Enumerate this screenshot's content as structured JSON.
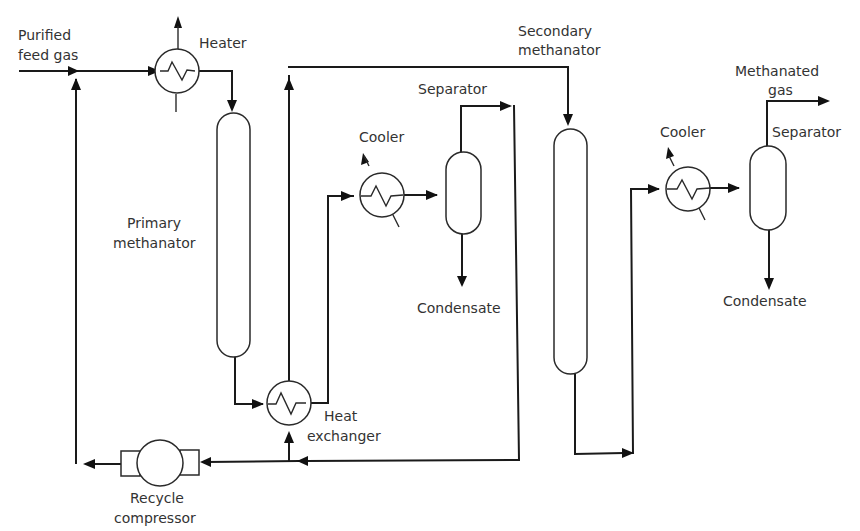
{
  "diagram": {
    "type": "process flow diagram",
    "labels": {
      "feed_line1": "Purified",
      "feed_line2": "feed gas",
      "heater": "Heater",
      "primary_line1": "Primary",
      "primary_line2": "methanator",
      "heat_exchanger_line1": "Heat",
      "heat_exchanger_line2": "exchanger",
      "cooler1": "Cooler",
      "separator1": "Separator",
      "condensate1": "Condensate",
      "secondary_line1": "Secondary",
      "secondary_line2": "methanator",
      "cooler2": "Cooler",
      "separator2": "Separator",
      "product_line1": "Methanated",
      "product_line2": "gas",
      "condensate2": "Condensate",
      "compressor_line1": "Recycle",
      "compressor_line2": "compressor"
    },
    "nodes": [
      {
        "id": "feed",
        "label": "Purified feed gas",
        "kind": "inlet"
      },
      {
        "id": "heater",
        "label": "Heater",
        "kind": "heat-exchanger"
      },
      {
        "id": "primary",
        "label": "Primary methanator",
        "kind": "reactor"
      },
      {
        "id": "hx",
        "label": "Heat exchanger",
        "kind": "heat-exchanger"
      },
      {
        "id": "cooler1",
        "label": "Cooler",
        "kind": "cooler"
      },
      {
        "id": "sep1",
        "label": "Separator",
        "kind": "separator"
      },
      {
        "id": "cond1",
        "label": "Condensate",
        "kind": "outlet"
      },
      {
        "id": "compressor",
        "label": "Recycle compressor",
        "kind": "compressor"
      },
      {
        "id": "secondary",
        "label": "Secondary methanator",
        "kind": "reactor"
      },
      {
        "id": "cooler2",
        "label": "Cooler",
        "kind": "cooler"
      },
      {
        "id": "sep2",
        "label": "Separator",
        "kind": "separator"
      },
      {
        "id": "cond2",
        "label": "Condensate",
        "kind": "outlet"
      },
      {
        "id": "product",
        "label": "Methanated gas",
        "kind": "outlet"
      }
    ],
    "edges": [
      {
        "from": "feed",
        "to": "heater"
      },
      {
        "from": "heater",
        "to": "primary"
      },
      {
        "from": "primary",
        "to": "hx"
      },
      {
        "from": "hx",
        "to": "cooler1"
      },
      {
        "from": "cooler1",
        "to": "sep1"
      },
      {
        "from": "sep1",
        "to": "cond1"
      },
      {
        "from": "sep1",
        "to": "compressor"
      },
      {
        "from": "sep1",
        "to": "hx",
        "note": "split stream reheated in heat exchanger"
      },
      {
        "from": "hx",
        "to": "secondary"
      },
      {
        "from": "compressor",
        "to": "heater",
        "note": "recycle joins feed"
      },
      {
        "from": "secondary",
        "to": "cooler2"
      },
      {
        "from": "cooler2",
        "to": "sep2"
      },
      {
        "from": "sep2",
        "to": "cond2"
      },
      {
        "from": "sep2",
        "to": "product"
      }
    ]
  }
}
